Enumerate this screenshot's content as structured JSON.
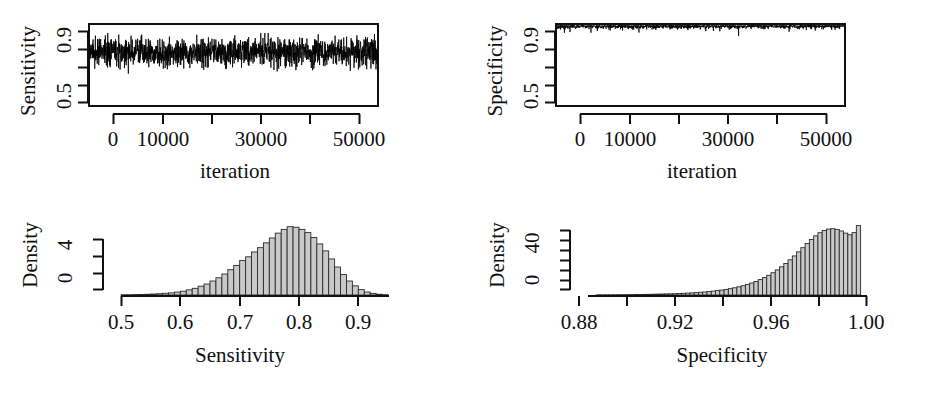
{
  "figure": {
    "background": "#ffffff",
    "ink": "#101010",
    "bar_fill": "#c9c9c9",
    "bar_stroke": "#2a2a2a"
  },
  "panels": [
    {
      "id": "sensitivity-trace",
      "ylabel": "Sensitivity",
      "xlabel": "iteration",
      "x_tick_labels": [
        "0",
        "10000",
        "30000",
        "50000"
      ],
      "y_tick_labels": [
        "0.5",
        "0.9"
      ]
    },
    {
      "id": "specificity-trace",
      "ylabel": "Specificity",
      "xlabel": "iteration",
      "x_tick_labels": [
        "0",
        "10000",
        "30000",
        "50000"
      ],
      "y_tick_labels": [
        "0.5",
        "0.9"
      ]
    },
    {
      "id": "sensitivity-density",
      "ylabel": "Density",
      "xlabel": "Sensitivity",
      "x_tick_labels": [
        "0.5",
        "0.6",
        "0.7",
        "0.8",
        "0.9"
      ],
      "y_tick_labels": [
        "0",
        "4"
      ]
    },
    {
      "id": "specificity-density",
      "ylabel": "Density",
      "xlabel": "Specificity",
      "x_tick_labels": [
        "0.88",
        "0.92",
        "0.96",
        "1.00"
      ],
      "y_tick_labels": [
        "0",
        "40"
      ]
    }
  ],
  "chart_data": [
    {
      "type": "line",
      "id": "sensitivity-trace",
      "title": "",
      "xlabel": "iteration",
      "ylabel": "Sensitivity",
      "xlim": [
        0,
        50000
      ],
      "ylim": [
        0.45,
        0.95
      ],
      "x_ticks": [
        0,
        10000,
        20000,
        30000,
        40000,
        50000
      ],
      "x_ticks_labeled": [
        0,
        10000,
        30000,
        50000
      ],
      "y_ticks": [
        0.5,
        0.6,
        0.7,
        0.8,
        0.9
      ],
      "y_ticks_labeled": [
        0.5,
        0.9
      ],
      "grid": false,
      "legend": null,
      "description": "MCMC trace of Sensitivity over 50000 iterations; stationary noise band",
      "series": [
        {
          "name": "Sensitivity",
          "mean": 0.78,
          "sd": 0.043,
          "min": 0.6,
          "max": 0.9,
          "n_iterations": 50000,
          "color": "#000000"
        }
      ]
    },
    {
      "type": "line",
      "id": "specificity-trace",
      "title": "",
      "xlabel": "iteration",
      "ylabel": "Specificity",
      "xlim": [
        0,
        50000
      ],
      "ylim": [
        0.45,
        1.0
      ],
      "x_ticks": [
        0,
        10000,
        20000,
        30000,
        40000,
        50000
      ],
      "x_ticks_labeled": [
        0,
        10000,
        30000,
        50000
      ],
      "y_ticks": [
        0.5,
        0.6,
        0.7,
        0.8,
        0.9
      ],
      "y_ticks_labeled": [
        0.5,
        0.9
      ],
      "grid": false,
      "legend": null,
      "description": "MCMC trace of Specificity over 50000 iterations; tight band near 1.0",
      "series": [
        {
          "name": "Specificity",
          "mean": 0.982,
          "sd": 0.012,
          "min": 0.925,
          "max": 1.0,
          "n_iterations": 50000,
          "color": "#000000"
        }
      ]
    },
    {
      "type": "bar",
      "id": "sensitivity-density",
      "title": "",
      "xlabel": "Sensitivity",
      "ylabel": "Density",
      "xlim": [
        0.5,
        0.95
      ],
      "ylim": [
        0,
        6.6
      ],
      "x_ticks": [
        0.5,
        0.6,
        0.7,
        0.8,
        0.9
      ],
      "x_ticks_labeled": [
        0.5,
        0.6,
        0.7,
        0.8,
        0.9
      ],
      "y_ticks": [
        0,
        2,
        4,
        6
      ],
      "y_ticks_labeled": [
        0,
        4
      ],
      "grid": false,
      "legend": null,
      "bin_width": 0.01,
      "description": "Posterior density histogram of Sensitivity, approx normal, peak near 0.78",
      "bin_starts": [
        0.5,
        0.51,
        0.52,
        0.53,
        0.54,
        0.55,
        0.56,
        0.57,
        0.58,
        0.59,
        0.6,
        0.61,
        0.62,
        0.63,
        0.64,
        0.65,
        0.66,
        0.67,
        0.68,
        0.69,
        0.7,
        0.71,
        0.72,
        0.73,
        0.74,
        0.75,
        0.76,
        0.77,
        0.78,
        0.79,
        0.8,
        0.81,
        0.82,
        0.83,
        0.84,
        0.85,
        0.86,
        0.87,
        0.88,
        0.89,
        0.9,
        0.91,
        0.92,
        0.93,
        0.94
      ],
      "values": [
        0.02,
        0.03,
        0.04,
        0.05,
        0.07,
        0.09,
        0.12,
        0.16,
        0.2,
        0.27,
        0.35,
        0.48,
        0.62,
        0.82,
        1.02,
        1.3,
        1.6,
        1.95,
        2.35,
        2.75,
        3.2,
        3.55,
        4.0,
        4.4,
        4.85,
        5.3,
        5.75,
        6.1,
        6.35,
        6.3,
        6.1,
        5.8,
        5.35,
        4.75,
        4.1,
        3.35,
        2.6,
        1.9,
        1.3,
        0.85,
        0.5,
        0.28,
        0.15,
        0.07,
        0.03
      ]
    },
    {
      "type": "bar",
      "id": "specificity-density",
      "title": "",
      "xlabel": "Specificity",
      "ylabel": "Density",
      "xlim": [
        0.868,
        1.003
      ],
      "ylim": [
        0,
        66
      ],
      "x_ticks": [
        0.88,
        0.9,
        0.92,
        0.94,
        0.96,
        0.98,
        1.0
      ],
      "x_ticks_labeled": [
        0.88,
        0.92,
        0.96,
        1.0
      ],
      "y_ticks": [
        0,
        10,
        20,
        30,
        40,
        50,
        60
      ],
      "y_ticks_labeled": [
        0,
        40
      ],
      "grid": false,
      "legend": null,
      "bin_width": 0.002,
      "description": "Posterior density histogram of Specificity, strongly right-skewed toward 1.00",
      "bin_starts": [
        0.87,
        0.872,
        0.874,
        0.876,
        0.878,
        0.88,
        0.882,
        0.884,
        0.886,
        0.888,
        0.89,
        0.892,
        0.894,
        0.896,
        0.898,
        0.9,
        0.902,
        0.904,
        0.906,
        0.908,
        0.91,
        0.912,
        0.914,
        0.916,
        0.918,
        0.92,
        0.922,
        0.924,
        0.926,
        0.928,
        0.93,
        0.932,
        0.934,
        0.936,
        0.938,
        0.94,
        0.942,
        0.944,
        0.946,
        0.948,
        0.95,
        0.952,
        0.954,
        0.956,
        0.958,
        0.96,
        0.962,
        0.964,
        0.966,
        0.968,
        0.97,
        0.972,
        0.974,
        0.976,
        0.978,
        0.98,
        0.982,
        0.984,
        0.986,
        0.988,
        0.99,
        0.992,
        0.994,
        0.996,
        0.998
      ],
      "values": [
        0.1,
        0.1,
        0.1,
        0.15,
        0.15,
        0.2,
        0.2,
        0.25,
        0.3,
        0.3,
        0.35,
        0.4,
        0.45,
        0.5,
        0.55,
        0.6,
        0.7,
        0.8,
        0.9,
        1.0,
        1.1,
        1.25,
        1.4,
        1.55,
        1.75,
        1.95,
        2.2,
        2.5,
        2.8,
        3.2,
        3.6,
        4.1,
        4.6,
        5.2,
        5.9,
        6.7,
        7.6,
        8.6,
        9.8,
        11.1,
        12.6,
        14.3,
        16.2,
        18.3,
        20.7,
        23.3,
        26.2,
        29.3,
        32.7,
        36.3,
        40.1,
        44.0,
        47.9,
        51.6,
        55.0,
        57.9,
        60.0,
        61.3,
        61.6,
        61.0,
        59.5,
        57.5,
        56.0,
        58.0,
        64.5
      ]
    }
  ]
}
